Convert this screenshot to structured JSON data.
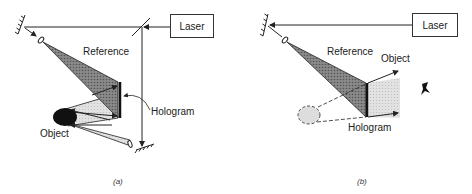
{
  "panel_a": {
    "laser_label": "Laser",
    "reference_label": "Reference",
    "hologram_label": "Hologram",
    "object_label": "Object",
    "caption": "(a)"
  },
  "panel_b": {
    "laser_label": "Laser",
    "reference_label": "Reference",
    "object_label": "Object",
    "hologram_label": "Hologram",
    "caption": "(b)"
  },
  "colors": {
    "line": "#222222",
    "reference_beam": "#7a7a7a",
    "object_beam": "#d6d6d6",
    "object_fill": "#111111"
  }
}
